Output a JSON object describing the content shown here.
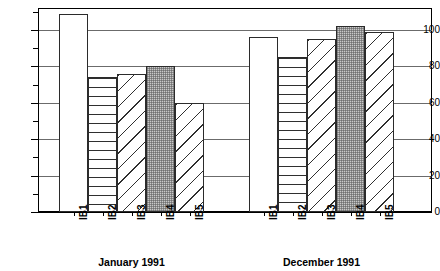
{
  "chart_data": {
    "type": "bar",
    "title": "",
    "xlabel": "",
    "ylabel": "",
    "ylim": [
      0,
      112
    ],
    "grid": true,
    "legend": "none",
    "y_ticks_major": [
      0,
      20,
      40,
      60,
      80,
      100
    ],
    "y_ticks_minor": [
      10,
      30,
      50,
      70,
      90,
      110
    ],
    "categories": [
      "IB1",
      "IB2",
      "IB3",
      "IB4",
      "IB5"
    ],
    "groups": [
      {
        "label": "January 1991",
        "values": [
          109,
          74,
          76,
          80,
          60
        ],
        "bars": [
          {
            "category": "IB1",
            "value": 109,
            "pattern": "solid-white"
          },
          {
            "category": "IB2",
            "value": 74,
            "pattern": "horizontal-lines"
          },
          {
            "category": "IB3",
            "value": 76,
            "pattern": "diagonal-lines"
          },
          {
            "category": "IB4",
            "value": 80,
            "pattern": "gray-stipple"
          },
          {
            "category": "IB5",
            "value": 60,
            "pattern": "diagonal-lines"
          }
        ]
      },
      {
        "label": "December 1991",
        "values": [
          96,
          85,
          95,
          102,
          99
        ],
        "bars": [
          {
            "category": "IB1",
            "value": 96,
            "pattern": "solid-white"
          },
          {
            "category": "IB2",
            "value": 85,
            "pattern": "horizontal-lines"
          },
          {
            "category": "IB3",
            "value": 95,
            "pattern": "diagonal-lines"
          },
          {
            "category": "IB4",
            "value": 102,
            "pattern": "gray-stipple"
          },
          {
            "category": "IB5",
            "value": 99,
            "pattern": "diagonal-lines"
          }
        ]
      }
    ],
    "colors": {
      "axis": "#000000",
      "gridline": "#6b6b6b",
      "bar_outline": "#2b2b2b",
      "stipple_fill": "#c9c9c9",
      "background": "#ffffff"
    }
  }
}
